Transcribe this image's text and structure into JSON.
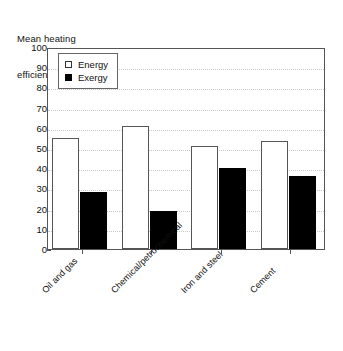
{
  "chart_data": {
    "type": "bar",
    "title": "Mean heating efficiencies (%)",
    "title_lines": [
      "Mean heating",
      "efficiencies (%)"
    ],
    "xlabel": "",
    "ylabel": "Mean heating efficiencies (%)",
    "ylim": [
      0,
      100
    ],
    "ytick_step": 10,
    "ytick_labels": [
      "0",
      "10",
      "20",
      "30",
      "40",
      "50",
      "60",
      "70",
      "80",
      "90",
      "100"
    ],
    "grid": true,
    "grid_orientation": "horizontal",
    "legend_position": "top-left",
    "categories": [
      "Oil and gas",
      "Chemical/petrochemical",
      "Iron and steel",
      "Cement"
    ],
    "series": [
      {
        "name": "Energy",
        "values": [
          55,
          61,
          51,
          53.5
        ],
        "color": "#ffffff",
        "edge_color": "#555555"
      },
      {
        "name": "Exergy",
        "values": [
          28,
          19,
          40,
          36
        ],
        "color": "#000000",
        "edge_color": "#000000"
      }
    ]
  },
  "legend": {
    "entries": [
      {
        "label": "Energy",
        "swatch": "open-square"
      },
      {
        "label": "Exergy",
        "swatch": "filled-square"
      }
    ]
  },
  "colors": {
    "background": "#ffffff",
    "axis": "#555555",
    "grid": "#c9c9c9",
    "text": "#111111",
    "energy_fill": "#ffffff",
    "exergy_fill": "#000000"
  }
}
